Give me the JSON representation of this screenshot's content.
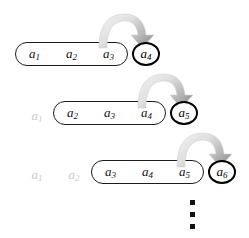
{
  "diagram": {
    "background_color": "#ffffff",
    "ink_color": "#111111",
    "faded_color": "#c9c9c9",
    "arrow_color_light": "#e3e3e3",
    "arrow_color_dark": "#8f8f8f",
    "arrow_icon_name": "curved-arrow-icon",
    "continuation_symbol": "vertical-ellipsis",
    "rows": [
      {
        "row_label": "step-1",
        "dropped": [],
        "window": {
          "terms": [
            {
              "base": "a",
              "sub": "1",
              "text": "a1"
            },
            {
              "base": "a",
              "sub": "2",
              "text": "a2"
            },
            {
              "base": "a",
              "sub": "3",
              "text": "a3"
            }
          ]
        },
        "incoming": {
          "base": "a",
          "sub": "4",
          "text": "a4"
        },
        "arrow": {
          "from": "a3",
          "to": "a4",
          "direction": "right"
        }
      },
      {
        "row_label": "step-2",
        "dropped": [
          {
            "base": "a",
            "sub": "1",
            "text": "a1"
          }
        ],
        "window": {
          "terms": [
            {
              "base": "a",
              "sub": "2",
              "text": "a2"
            },
            {
              "base": "a",
              "sub": "3",
              "text": "a3"
            },
            {
              "base": "a",
              "sub": "4",
              "text": "a4"
            }
          ]
        },
        "incoming": {
          "base": "a",
          "sub": "5",
          "text": "a5"
        },
        "arrow": {
          "from": "a4",
          "to": "a5",
          "direction": "right"
        }
      },
      {
        "row_label": "step-3",
        "dropped": [
          {
            "base": "a",
            "sub": "1",
            "text": "a1"
          },
          {
            "base": "a",
            "sub": "2",
            "text": "a2"
          }
        ],
        "window": {
          "terms": [
            {
              "base": "a",
              "sub": "3",
              "text": "a3"
            },
            {
              "base": "a",
              "sub": "4",
              "text": "a4"
            },
            {
              "base": "a",
              "sub": "5",
              "text": "a5"
            }
          ]
        },
        "incoming": {
          "base": "a",
          "sub": "6",
          "text": "a6"
        },
        "arrow": {
          "from": "a5",
          "to": "a6",
          "direction": "right"
        }
      }
    ],
    "ellipsis_dots": 3
  }
}
